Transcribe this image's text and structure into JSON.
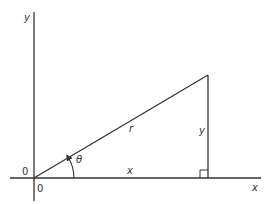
{
  "diagram": {
    "type": "right-triangle-polar-coordinates",
    "axes": {
      "x_label": "x",
      "y_label": "y",
      "origin_label_left": "0",
      "origin_label_below": "0"
    },
    "triangle": {
      "hypotenuse_label": "r",
      "base_label": "x",
      "height_label": "y",
      "angle_label": "θ",
      "right_angle_marker": true
    },
    "colors": {
      "line": "#333333",
      "background": "#ffffff"
    }
  }
}
